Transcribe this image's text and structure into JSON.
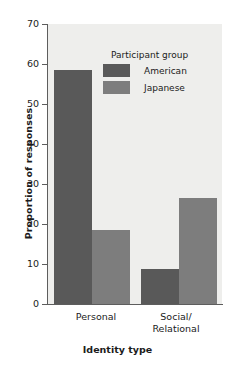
{
  "chart_data": {
    "type": "bar",
    "title": "",
    "xlabel": "Identity type",
    "ylabel": "Proportion of responses",
    "categories": [
      "Personal",
      "Social/\nRelational"
    ],
    "category_lines": [
      [
        "Personal"
      ],
      [
        "Social/",
        "Relational"
      ]
    ],
    "series": [
      {
        "name": "American",
        "values": [
          58.5,
          8.8
        ],
        "color": "#595959"
      },
      {
        "name": "Japanese",
        "values": [
          18.5,
          26.5
        ],
        "color": "#7d7d7d"
      }
    ],
    "ylim": [
      0,
      70
    ],
    "yticks": [
      0,
      10,
      20,
      30,
      40,
      50,
      60,
      70
    ],
    "ytick_labels": [
      "0",
      "10",
      "20",
      "30",
      "40",
      "50",
      "60",
      "70"
    ],
    "grid": false,
    "legend": {
      "title": "Participant group",
      "position": "upper-center",
      "entries": [
        {
          "label": "American",
          "color": "#595959"
        },
        {
          "label": "Japanese",
          "color": "#7d7d7d"
        }
      ]
    },
    "plot_background": "#eeeeec",
    "axis_color": "#5d5d5d"
  }
}
